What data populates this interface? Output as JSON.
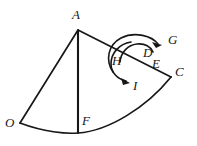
{
  "figure": {
    "background_color": "#ffffff",
    "stroke_color": "#171717",
    "width": 197,
    "height": 146,
    "labels": [
      {
        "text": "A",
        "x": 72,
        "y": 8,
        "size": 13
      },
      {
        "text": "G",
        "x": 168,
        "y": 33,
        "size": 13
      },
      {
        "text": "D",
        "x": 143,
        "y": 46,
        "size": 13
      },
      {
        "text": "E",
        "x": 152,
        "y": 57,
        "size": 13
      },
      {
        "text": "C",
        "x": 175,
        "y": 65,
        "size": 13
      },
      {
        "text": "H",
        "x": 112,
        "y": 54,
        "size": 13
      },
      {
        "text": "I",
        "x": 133,
        "y": 79,
        "size": 13
      },
      {
        "text": "O",
        "x": 5,
        "y": 116,
        "size": 13
      },
      {
        "text": "F",
        "x": 82,
        "y": 114,
        "size": 13
      }
    ],
    "vertices": {
      "A": {
        "x": 78,
        "y": 30
      },
      "O": {
        "x": 20,
        "y": 123
      },
      "C": {
        "x": 170,
        "y": 76
      },
      "F": {
        "x": 78,
        "y": 133
      },
      "D": {
        "x": 140,
        "y": 57
      },
      "E": {
        "x": 148,
        "y": 62
      },
      "H": {
        "x": 122,
        "y": 56
      },
      "G": {
        "x": 163,
        "y": 43
      },
      "I": {
        "x": 129,
        "y": 82
      }
    },
    "segments": [
      {
        "name": "segment-OA",
        "from": "O",
        "to": "A"
      },
      {
        "name": "segment-AC",
        "from": "A",
        "to": "C"
      },
      {
        "name": "segment-AF",
        "from": "A",
        "to": "F"
      }
    ],
    "arcs": [
      {
        "name": "arc-OFC",
        "description": "bottom arc of sector from O through F to C"
      },
      {
        "name": "arc-to-G",
        "description": "angle arc sweeping clockwise up to arrowhead at G"
      },
      {
        "name": "arc-to-I",
        "description": "angle arc sweeping down to arrowhead at I"
      },
      {
        "name": "arc-H-circle",
        "description": "small arc through H"
      }
    ],
    "arrowheads": [
      {
        "name": "arrowhead-G",
        "at": "G",
        "direction": "right"
      },
      {
        "name": "arrowhead-I",
        "at": "I",
        "direction": "down-right"
      }
    ]
  }
}
